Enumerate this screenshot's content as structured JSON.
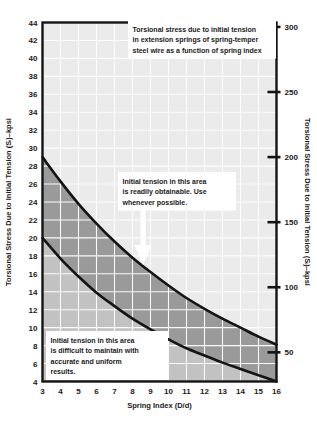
{
  "chart_data": {
    "type": "area",
    "xlabel": "Spring Index (D/d)",
    "ylabel": "Torsional Stress Due to Initial Tension (Sᵢ)–kpsi",
    "ylabel_right": "Torsional Stress Due to Initial Tension (Sᵢ)–kpsi",
    "xlim": [
      3,
      16
    ],
    "ylim": [
      4,
      44
    ],
    "ylim_right": [
      27.6,
      303.4
    ],
    "grid": true,
    "legend": "none",
    "xticks": [
      3,
      4,
      5,
      6,
      7,
      8,
      9,
      10,
      11,
      12,
      13,
      14,
      15,
      16
    ],
    "xtick_labels": [
      "3",
      "4",
      "5",
      "6",
      "7",
      "8",
      "9",
      "10",
      "11",
      "12",
      "13",
      "14",
      "15",
      "16"
    ],
    "yticks": [
      4,
      6,
      8,
      10,
      12,
      14,
      16,
      18,
      20,
      22,
      24,
      26,
      28,
      30,
      32,
      34,
      36,
      38,
      40,
      42,
      44
    ],
    "ytick_labels": [
      "4",
      "6",
      "8",
      "10",
      "12",
      "14",
      "16",
      "18",
      "20",
      "22",
      "24",
      "26",
      "28",
      "30",
      "32",
      "34",
      "36",
      "38",
      "40",
      "42",
      "44"
    ],
    "yticks_right": [
      50,
      100,
      150,
      200,
      250,
      300
    ],
    "ytick_labels_right": [
      "50",
      "100",
      "150",
      "200",
      "250",
      "300"
    ],
    "series": [
      {
        "name": "Upper bound of preferred initial tension range",
        "x": [
          3,
          4,
          5,
          6,
          7,
          8,
          9,
          10,
          11,
          12,
          13,
          14,
          15,
          16
        ],
        "values": [
          29.0,
          26.3,
          23.8,
          21.6,
          19.6,
          17.8,
          16.2,
          14.7,
          13.3,
          12.1,
          11.0,
          10.0,
          9.0,
          8.1
        ]
      },
      {
        "name": "Lower bound of preferred initial tension range",
        "x": [
          3,
          4,
          5,
          6,
          7,
          8,
          9,
          10,
          11,
          12,
          13,
          14,
          15,
          16
        ],
        "values": [
          20.0,
          17.7,
          15.7,
          13.9,
          12.4,
          11.0,
          9.8,
          8.7,
          7.7,
          6.9,
          6.1,
          5.4,
          4.7,
          4.0
        ]
      }
    ],
    "regions": [
      {
        "name": "preferred-band",
        "label": "Initial tension in this area is readily obtainable. Use whenever possible.",
        "fill": "#9e9e9e"
      },
      {
        "name": "difficult-band",
        "label": "Initial tension in this area is difficult to maintain with accurate and uniform results.",
        "fill": "#c9c9c9"
      },
      {
        "name": "upper-region",
        "fill": "#ebebeb"
      }
    ],
    "annotations": [
      {
        "name": "title-callout",
        "lines": [
          "Torsional stress due to initial tension",
          "in extension springs of spring-temper",
          "steel wire as a function of spring index"
        ]
      },
      {
        "name": "readily-obtainable-callout",
        "lines": [
          "Initial tension in this area",
          "is readily obtainable. Use",
          "whenever possible."
        ]
      },
      {
        "name": "difficult-callout",
        "lines": [
          "Initial tension in this area",
          "is difficult to maintain with",
          "accurate and uniform",
          "results."
        ]
      }
    ],
    "colors": {
      "plot_background": "#ebebeb",
      "gridline": "#ffffff",
      "band_upper": "#c2c2c2",
      "band_lower": "#9a9a9a",
      "curve": "#141414",
      "frame": "#141414",
      "text": "#1a1a1a",
      "callout_background": "#ffffff",
      "arrow": "#ffffff"
    }
  }
}
